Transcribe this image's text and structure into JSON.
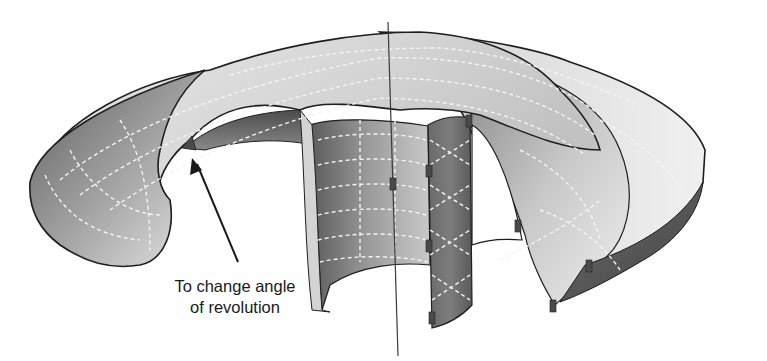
{
  "figure": {
    "colors": {
      "background": "#ffffff",
      "surface_light": "#e8e8e8",
      "surface_mid": "#a8a8a8",
      "surface_dark": "#585858",
      "edge": "#1e1e1e",
      "isolines": "#f4f4f4",
      "handle": "#4a4a4a"
    }
  },
  "callout": {
    "line1": "To change angle",
    "line2": "of revolution",
    "arrow_target": "angle-of-revolution-handle"
  }
}
